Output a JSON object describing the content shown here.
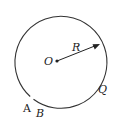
{
  "diagram": {
    "center_label": "O",
    "radius_label": "R",
    "point_labels": [
      "A",
      "B",
      "Q"
    ],
    "stroke_color": "#333333"
  }
}
